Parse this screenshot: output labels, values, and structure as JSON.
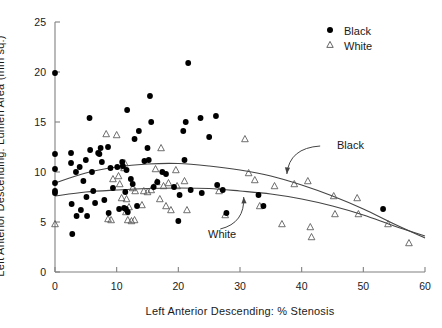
{
  "chart_data": {
    "type": "scatter",
    "title": "",
    "xlabel": "Left Anterior Descending: % Stenosis",
    "ylabel": "Left Anterior Descending: Lumen Area (mm sq.)",
    "xlim": [
      0,
      60
    ],
    "ylim": [
      0,
      25
    ],
    "xticks": [
      0,
      10,
      20,
      30,
      40,
      50,
      60
    ],
    "yticks": [
      0,
      5,
      10,
      15,
      20,
      25
    ],
    "xtick_labels": [
      "0",
      "10",
      "20",
      "30",
      "40",
      "50",
      "60"
    ],
    "ytick_labels": [
      "0",
      "5",
      "10",
      "15",
      "20",
      "25"
    ],
    "grid": false,
    "legend_position": "top-right",
    "legend": [
      {
        "name": "Black",
        "marker": "filled-circle",
        "color": "#000000"
      },
      {
        "name": "White",
        "marker": "open-triangle",
        "color": "#000000"
      }
    ],
    "annotations": [
      {
        "text": "Black",
        "x": 44.5,
        "y": 13.2,
        "points_to": {
          "x": 37.5,
          "y": 9.6
        }
      },
      {
        "text": "White",
        "x": 23.5,
        "y": 3.9,
        "points_to": {
          "x": 30.5,
          "y": 7.3
        }
      }
    ],
    "series": [
      {
        "name": "Black",
        "marker": "filled-circle",
        "color": "#000000",
        "points": [
          [
            0.0,
            19.9
          ],
          [
            0.0,
            11.8
          ],
          [
            0.0,
            10.3
          ],
          [
            0.0,
            8.9
          ],
          [
            0.0,
            8.1
          ],
          [
            0.0,
            7.9
          ],
          [
            2.6,
            11.9
          ],
          [
            2.6,
            10.9
          ],
          [
            2.7,
            6.8
          ],
          [
            2.8,
            3.8
          ],
          [
            3.4,
            10.0
          ],
          [
            3.5,
            5.6
          ],
          [
            4.0,
            10.5
          ],
          [
            4.2,
            6.2
          ],
          [
            4.6,
            9.1
          ],
          [
            5.0,
            11.2
          ],
          [
            5.1,
            7.5
          ],
          [
            5.2,
            5.6
          ],
          [
            5.6,
            15.4
          ],
          [
            5.7,
            12.2
          ],
          [
            6.0,
            10.0
          ],
          [
            6.2,
            8.1
          ],
          [
            6.5,
            6.9
          ],
          [
            7.0,
            11.9
          ],
          [
            7.2,
            11.8
          ],
          [
            7.4,
            12.4
          ],
          [
            7.6,
            11.0
          ],
          [
            8.0,
            7.2
          ],
          [
            8.6,
            12.5
          ],
          [
            8.7,
            5.9
          ],
          [
            9.0,
            10.4
          ],
          [
            9.4,
            8.4
          ],
          [
            10.1,
            10.5
          ],
          [
            10.4,
            6.3
          ],
          [
            10.9,
            11.0
          ],
          [
            11.0,
            10.6
          ],
          [
            11.2,
            6.4
          ],
          [
            11.4,
            8.0
          ],
          [
            11.5,
            6.3
          ],
          [
            11.6,
            10.2
          ],
          [
            11.7,
            16.2
          ],
          [
            11.8,
            6.0
          ],
          [
            12.3,
            9.3
          ],
          [
            12.6,
            8.8
          ],
          [
            12.9,
            13.3
          ],
          [
            13.3,
            6.6
          ],
          [
            13.6,
            14.1
          ],
          [
            14.5,
            11.1
          ],
          [
            15.0,
            12.4
          ],
          [
            15.2,
            11.2
          ],
          [
            15.4,
            17.6
          ],
          [
            15.6,
            15.0
          ],
          [
            16.0,
            8.5
          ],
          [
            16.6,
            9.0
          ],
          [
            17.4,
            10.0
          ],
          [
            18.0,
            9.8
          ],
          [
            19.3,
            8.5
          ],
          [
            20.0,
            5.1
          ],
          [
            20.2,
            7.7
          ],
          [
            20.8,
            14.1
          ],
          [
            21.0,
            11.2
          ],
          [
            21.2,
            15.0
          ],
          [
            21.6,
            20.9
          ],
          [
            22.0,
            8.2
          ],
          [
            23.6,
            15.4
          ],
          [
            23.8,
            7.9
          ],
          [
            25.0,
            13.5
          ],
          [
            26.1,
            15.6
          ],
          [
            26.3,
            8.7
          ],
          [
            27.2,
            8.2
          ],
          [
            27.8,
            5.9
          ],
          [
            33.0,
            7.7
          ],
          [
            33.8,
            6.6
          ],
          [
            53.2,
            6.3
          ]
        ]
      },
      {
        "name": "White",
        "marker": "open-triangle",
        "color": "#000000",
        "points": [
          [
            0.0,
            4.8
          ],
          [
            8.3,
            13.8
          ],
          [
            8.6,
            5.3
          ],
          [
            9.1,
            5.2
          ],
          [
            9.4,
            9.3
          ],
          [
            10.0,
            13.7
          ],
          [
            10.3,
            9.6
          ],
          [
            10.5,
            8.8
          ],
          [
            10.8,
            7.4
          ],
          [
            11.0,
            10.6
          ],
          [
            11.2,
            10.4
          ],
          [
            11.3,
            10.9
          ],
          [
            11.5,
            6.0
          ],
          [
            11.6,
            7.3
          ],
          [
            11.8,
            5.2
          ],
          [
            12.0,
            6.5
          ],
          [
            12.4,
            5.1
          ],
          [
            12.6,
            8.4
          ],
          [
            12.9,
            5.2
          ],
          [
            13.0,
            8.1
          ],
          [
            14.1,
            6.7
          ],
          [
            14.4,
            8.1
          ],
          [
            15.0,
            8.0
          ],
          [
            15.6,
            8.2
          ],
          [
            16.3,
            10.3
          ],
          [
            16.5,
            9.0
          ],
          [
            17.0,
            7.3
          ],
          [
            17.2,
            12.4
          ],
          [
            17.6,
            8.6
          ],
          [
            18.0,
            6.6
          ],
          [
            18.4,
            8.9
          ],
          [
            18.8,
            6.2
          ],
          [
            19.6,
            10.2
          ],
          [
            19.8,
            8.6
          ],
          [
            21.0,
            9.1
          ],
          [
            21.4,
            6.2
          ],
          [
            26.6,
            8.1
          ],
          [
            27.6,
            5.7
          ],
          [
            30.8,
            13.3
          ],
          [
            31.4,
            9.9
          ],
          [
            32.4,
            9.2
          ],
          [
            33.2,
            6.6
          ],
          [
            35.6,
            8.6
          ],
          [
            36.8,
            4.8
          ],
          [
            38.8,
            8.8
          ],
          [
            41.0,
            9.1
          ],
          [
            41.4,
            4.5
          ],
          [
            41.6,
            3.5
          ],
          [
            45.2,
            7.6
          ],
          [
            45.4,
            5.8
          ],
          [
            49.0,
            7.4
          ],
          [
            49.2,
            5.8
          ],
          [
            54.0,
            4.8
          ],
          [
            57.4,
            2.9
          ]
        ]
      }
    ],
    "fit_curves": [
      {
        "name": "Black",
        "description": "quadratic fit for Black, peaks near 10.8 around 20% stenosis",
        "points": [
          [
            0,
            8.9
          ],
          [
            5,
            9.9
          ],
          [
            10,
            10.5
          ],
          [
            15,
            10.8
          ],
          [
            20,
            10.85
          ],
          [
            25,
            10.6
          ],
          [
            30,
            10.2
          ],
          [
            35,
            9.6
          ],
          [
            40,
            8.7
          ],
          [
            45,
            7.6
          ],
          [
            50,
            6.3
          ],
          [
            55,
            4.8
          ],
          [
            60,
            3.4
          ]
        ]
      },
      {
        "name": "White",
        "description": "quadratic fit for White, nearly flat near 8.3 then declining",
        "points": [
          [
            0,
            7.6
          ],
          [
            5,
            8.0
          ],
          [
            10,
            8.2
          ],
          [
            15,
            8.35
          ],
          [
            20,
            8.4
          ],
          [
            25,
            8.35
          ],
          [
            30,
            8.1
          ],
          [
            35,
            7.8
          ],
          [
            40,
            7.3
          ],
          [
            45,
            6.6
          ],
          [
            50,
            5.7
          ],
          [
            55,
            4.6
          ],
          [
            60,
            3.6
          ]
        ]
      }
    ]
  },
  "legend": {
    "items": [
      {
        "label": "Black",
        "marker": "filled-circle"
      },
      {
        "label": "White",
        "marker": "open-triangle"
      }
    ]
  },
  "axes": {
    "x_title": "Left Anterior Descending: % Stenosis",
    "y_title": "Left Anterior Descending: Lumen Area (mm sq.)"
  },
  "annotations": {
    "black_label": "Black",
    "white_label": "White"
  },
  "colors": {
    "marker": "#000000",
    "axis": "#808080",
    "curve": "#444444",
    "text": "#1a1a1a",
    "background": "#ffffff"
  }
}
